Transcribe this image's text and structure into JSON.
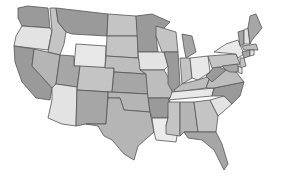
{
  "map": {
    "title": "",
    "type": "choropleth",
    "region": "Contiguous United States",
    "palette": {
      "lightest": "#ebebeb",
      "light": "#d2d2d2",
      "medium": "#bdbdbd",
      "dark": "#a4a4a4",
      "darkest": "#8f8f8f",
      "border": "#555555",
      "background": "#ffffff"
    },
    "states": [
      {
        "id": "WA",
        "shade": "#9a9a9a",
        "points": "18,8 28,6 48,8 50,28 22,26 18,18"
      },
      {
        "id": "OR",
        "shade": "#e3e3e3",
        "points": "22,26 50,28 52,31 48,50 14,46 16,36"
      },
      {
        "id": "CA",
        "shade": "#9a9a9a",
        "points": "14,46 34,49 32,66 52,88 50,100 36,98 22,82 15,62"
      },
      {
        "id": "ID",
        "shade": "#c4c4c4",
        "points": "50,8 56,8 58,22 66,32 64,44 60,55 48,52 52,31"
      },
      {
        "id": "NV",
        "shade": "#b5b5b5",
        "points": "34,49 60,55 56,84 52,88 32,66"
      },
      {
        "id": "MT",
        "shade": "#9a9a9a",
        "points": "56,8 108,14 107,36 72,34 66,32 58,22"
      },
      {
        "id": "WY",
        "shade": "#e8e8e8",
        "points": "76,44 106,46 105,68 74,66"
      },
      {
        "id": "UT",
        "shade": "#a6a6a6",
        "points": "60,55 74,56 74,66 80,66 77,87 56,84"
      },
      {
        "id": "AZ",
        "shade": "#e3e3e3",
        "points": "56,84 77,87 76,126 62,124 48,118 52,100 52,88"
      },
      {
        "id": "CO",
        "shade": "#c4c4c4",
        "points": "80,66 114,68 112,92 77,90"
      },
      {
        "id": "NM",
        "shade": "#a6a6a6",
        "points": "77,90 108,92 106,124 86,124 76,126"
      },
      {
        "id": "ND",
        "shade": "#c4c4c4",
        "points": "108,14 136,16 138,36 107,36"
      },
      {
        "id": "SD",
        "shade": "#c4c4c4",
        "points": "107,36 138,36 138,58 106,56"
      },
      {
        "id": "NE",
        "shade": "#bdbdbd",
        "points": "106,56 138,58 146,74 114,72 114,68 105,68"
      },
      {
        "id": "KS",
        "shade": "#a6a6a6",
        "points": "114,72 146,74 148,94 112,92"
      },
      {
        "id": "OK",
        "shade": "#b5b5b5",
        "points": "108,92 148,94 150,112 124,110 120,98 108,98"
      },
      {
        "id": "TX",
        "shade": "#b5b5b5",
        "points": "108,98 120,98 124,110 150,112 154,132 138,146 134,160 124,154 112,140 104,136 98,126 86,124 106,124"
      },
      {
        "id": "MN",
        "shade": "#9a9a9a",
        "points": "136,16 152,14 170,22 156,36 158,52 138,52"
      },
      {
        "id": "IA",
        "shade": "#e3e3e3",
        "points": "138,52 164,52 168,66 164,70 140,70"
      },
      {
        "id": "MO",
        "shade": "#bdbdbd",
        "points": "140,70 164,70 172,84 172,98 148,98 146,74"
      },
      {
        "id": "AR",
        "shade": "#9a9a9a",
        "points": "148,98 170,98 168,118 152,118 150,112"
      },
      {
        "id": "LA",
        "shade": "#ebebeb",
        "points": "152,118 168,118 166,126 178,130 176,142 156,140 154,132"
      },
      {
        "id": "WI",
        "shade": "#c4c4c4",
        "points": "156,26 176,32 178,52 162,52 156,36"
      },
      {
        "id": "IL",
        "shade": "#9a9a9a",
        "points": "164,52 178,52 180,84 174,94 168,84 168,66"
      },
      {
        "id": "MI",
        "shade": "#a6a6a6",
        "points": "182,34 192,36 196,52 186,58 184,48"
      },
      {
        "id": "IN",
        "shade": "#c4c4c4",
        "points": "180,58 190,58 192,78 182,84"
      },
      {
        "id": "OH",
        "shade": "#e8e8e8",
        "points": "190,58 208,56 210,72 198,80 192,78"
      },
      {
        "id": "KY",
        "shade": "#bdbdbd",
        "points": "174,90 182,84 198,80 210,76 206,88 176,92"
      },
      {
        "id": "TN",
        "shade": "#e8e8e8",
        "points": "170,98 172,92 214,88 212,96 168,100"
      },
      {
        "id": "MS",
        "shade": "#c4c4c4",
        "points": "168,102 180,102 180,136 166,134 166,126 168,118"
      },
      {
        "id": "AL",
        "shade": "#b5b5b5",
        "points": "180,102 194,102 198,132 184,132 180,136"
      },
      {
        "id": "GA",
        "shade": "#c4c4c4",
        "points": "194,102 210,100 218,116 216,132 198,132"
      },
      {
        "id": "FL",
        "shade": "#a6a6a6",
        "points": "184,132 216,132 222,144 228,164 224,170 214,150 202,140 188,138"
      },
      {
        "id": "SC",
        "shade": "#e3e3e3",
        "points": "210,100 224,96 232,104 218,116"
      },
      {
        "id": "NC",
        "shade": "#9a9a9a",
        "points": "212,96 214,88 244,82 240,96 232,104 224,96"
      },
      {
        "id": "VA",
        "shade": "#bdbdbd",
        "points": "206,88 210,78 226,70 236,72 244,82 214,88"
      },
      {
        "id": "WV",
        "shade": "#9a9a9a",
        "points": "206,76 210,72 214,66 222,68 226,70 212,82"
      },
      {
        "id": "PA",
        "shade": "#c4c4c4",
        "points": "208,56 236,54 240,64 212,68"
      },
      {
        "id": "NY",
        "shade": "#e8e8e8",
        "points": "214,52 226,44 238,40 244,54 238,58 236,54"
      },
      {
        "id": "VT",
        "shade": "#a6a6a6",
        "points": "238,32 244,30 244,44 240,46"
      },
      {
        "id": "NH",
        "shade": "#e3e3e3",
        "points": "244,30 248,28 250,44 244,44"
      },
      {
        "id": "ME",
        "shade": "#a6a6a6",
        "points": "248,28 250,16 256,14 262,28 252,40 250,44"
      },
      {
        "id": "MA",
        "shade": "#bdbdbd",
        "points": "242,46 256,44 258,50 244,50"
      },
      {
        "id": "CT",
        "shade": "#a6a6a6",
        "points": "242,52 250,50 250,56 244,58"
      },
      {
        "id": "RI",
        "shade": "#e3e3e3",
        "points": "250,50 254,50 254,55 250,56"
      },
      {
        "id": "NJ",
        "shade": "#c4c4c4",
        "points": "240,58 244,58 246,66 240,68"
      },
      {
        "id": "DE",
        "shade": "#e3e3e3",
        "points": "238,66 242,68 242,74 238,72"
      },
      {
        "id": "MD",
        "shade": "#a6a6a6",
        "points": "222,66 238,64 238,72 230,72 226,70"
      }
    ]
  }
}
